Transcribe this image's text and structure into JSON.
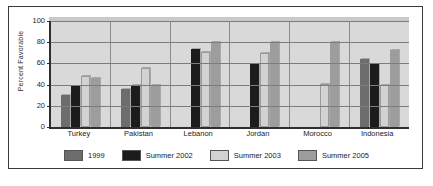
{
  "chart_data": {
    "type": "bar",
    "title": "",
    "xlabel": "",
    "ylabel": "Percent Favorable",
    "ylim": [
      0,
      100
    ],
    "yticks": [
      100,
      80,
      60,
      40,
      20,
      0
    ],
    "grid": true,
    "legend_position": "bottom",
    "categories": [
      "Turkey",
      "Pakistan",
      "Lebanon",
      "Jordan",
      "Morocco",
      "Indonesia"
    ],
    "series": [
      {
        "name": "1999",
        "color": "#6d6d6d",
        "values": [
          30,
          36,
          null,
          null,
          null,
          64
        ]
      },
      {
        "name": "Summer 2002",
        "color": "#1c1c1c",
        "values": [
          39,
          40,
          74,
          59,
          null,
          59
        ]
      },
      {
        "name": "Summer 2003",
        "color": "#d2d2d2",
        "values": [
          48,
          56,
          71,
          70,
          41,
          40
        ]
      },
      {
        "name": "Summer 2005",
        "color": "#9d9d9d",
        "values": [
          46,
          40,
          80,
          80,
          80,
          73
        ]
      }
    ]
  },
  "legend": {
    "items": [
      {
        "label": "1999"
      },
      {
        "label": "Summer 2002"
      },
      {
        "label": "Summer 2003"
      },
      {
        "label": "Summer 2005"
      }
    ]
  }
}
